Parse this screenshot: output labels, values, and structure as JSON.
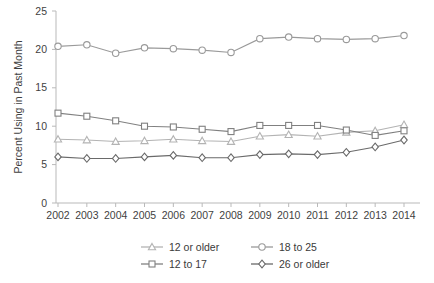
{
  "chart_data": {
    "type": "line",
    "title": "",
    "xlabel": "",
    "ylabel": "Percent Using in Past Month",
    "categories": [
      "2002",
      "2003",
      "2004",
      "2005",
      "2006",
      "2007",
      "2008",
      "2009",
      "2010",
      "2011",
      "2012",
      "2013",
      "2014"
    ],
    "x": [
      2002,
      2003,
      2004,
      2005,
      2006,
      2007,
      2008,
      2009,
      2010,
      2011,
      2012,
      2013,
      2014
    ],
    "ylim": [
      0,
      25
    ],
    "yticks": [
      0,
      5,
      10,
      15,
      20,
      25
    ],
    "ytick_labels": [
      "0",
      "5",
      "10",
      "15",
      "20",
      "25"
    ],
    "xtick_labels": [
      "2002",
      "2003",
      "2004",
      "2005",
      "2006",
      "2007",
      "2008",
      "2009",
      "2010",
      "2011",
      "2012",
      "2013",
      "2014"
    ],
    "grid": false,
    "legend_position": "bottom",
    "series": [
      {
        "name": "12 or older",
        "marker": "triangle",
        "color": "#b3b3b3",
        "values": [
          8.3,
          8.2,
          8.0,
          8.1,
          8.3,
          8.1,
          8.0,
          8.7,
          8.9,
          8.7,
          9.2,
          9.4,
          10.2
        ]
      },
      {
        "name": "12 to 17",
        "marker": "square",
        "color": "#808080",
        "values": [
          11.7,
          11.3,
          10.7,
          10.0,
          9.9,
          9.6,
          9.3,
          10.1,
          10.1,
          10.1,
          9.5,
          8.8,
          9.4
        ]
      },
      {
        "name": "18 to 25",
        "marker": "circle",
        "color": "#9a9a9a",
        "values": [
          20.4,
          20.6,
          19.5,
          20.2,
          20.1,
          19.9,
          19.6,
          21.4,
          21.6,
          21.4,
          21.3,
          21.4,
          21.8
        ]
      },
      {
        "name": "26 or older",
        "marker": "diamond",
        "color": "#6a6a6a",
        "values": [
          6.0,
          5.8,
          5.8,
          6.0,
          6.2,
          5.9,
          5.9,
          6.3,
          6.4,
          6.3,
          6.6,
          7.3,
          8.2
        ]
      }
    ],
    "legend_order": [
      "12 or older",
      "18 to 25",
      "12 to 17",
      "26 or older"
    ]
  },
  "legend": {
    "items": [
      {
        "label": "12 or older"
      },
      {
        "label": "18 to 25"
      },
      {
        "label": "12 to 17"
      },
      {
        "label": "26 or older"
      }
    ]
  },
  "axes": {
    "y_title": "Percent Using in Past Month"
  }
}
